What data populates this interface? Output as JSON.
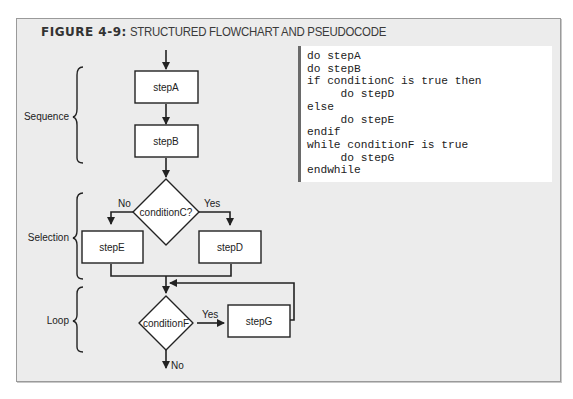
{
  "figure": {
    "number": "FIGURE 4-9:",
    "title": "STRUCTURED FLOWCHART AND PSEUDOCODE"
  },
  "flowchart": {
    "sections": [
      {
        "label": "Sequence"
      },
      {
        "label": "Selection"
      },
      {
        "label": "Loop"
      }
    ],
    "steps": {
      "stepA": "stepA",
      "stepB": "stepB",
      "stepD": "stepD",
      "stepE": "stepE",
      "stepG": "stepG"
    },
    "decisions": {
      "conditionC": "conditionC?",
      "conditionF": "conditionF"
    },
    "branch_labels": {
      "c_no": "No",
      "c_yes": "Yes",
      "f_yes": "Yes",
      "f_no": "No"
    },
    "colors": {
      "background": "#ececec",
      "box_fill": "#ffffff",
      "stroke": "#222222"
    }
  },
  "pseudocode": {
    "lines": [
      "do stepA",
      "do stepB",
      "if conditionC is true then",
      "     do stepD",
      "else",
      "     do stepE",
      "endif",
      "while conditionF is true",
      "     do stepG",
      "endwhile"
    ]
  }
}
